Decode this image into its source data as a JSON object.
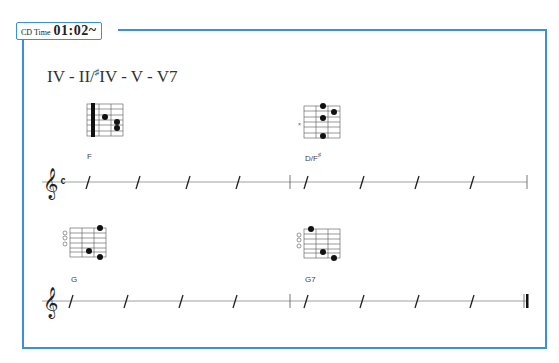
{
  "header": {
    "cd_label": "CD Time",
    "cd_time": "01:02~"
  },
  "progression": {
    "title_main": "IV - II/",
    "title_sharp": "♯",
    "title_rest": "IV - V - V7"
  },
  "systems": [
    {
      "clef": "treble",
      "time_signature": "C",
      "measures": [
        {
          "chord": "F",
          "beats": 4
        },
        {
          "chord": "D/F",
          "chord_sup": "♯",
          "beats": 4
        }
      ]
    },
    {
      "clef": "treble",
      "measures": [
        {
          "chord": "G",
          "beats": 4
        },
        {
          "chord": "G7",
          "beats": 4
        }
      ],
      "end": "final-barline"
    }
  ],
  "chord_diagrams": [
    {
      "name": "F",
      "barre": true,
      "fret_numbers": [
        "1",
        "2",
        "3"
      ]
    },
    {
      "name": "D/F♯",
      "muted": "×",
      "fret_numbers": [
        "1",
        "2",
        "3"
      ]
    },
    {
      "name": "G",
      "open_strings": [
        "○",
        "○",
        "○"
      ],
      "fret_numbers": [
        "1",
        "2",
        "3"
      ]
    },
    {
      "name": "G7",
      "open_strings": [
        "○",
        "○",
        "○"
      ],
      "fret_numbers": [
        "1",
        "2",
        "3"
      ]
    }
  ],
  "colors": {
    "accent": "#3b8fdc",
    "ink": "#222222",
    "staff": "#888888"
  }
}
